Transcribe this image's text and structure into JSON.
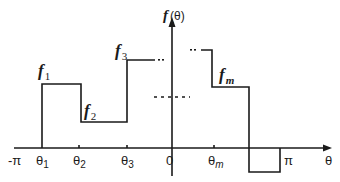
{
  "diagram": {
    "y_axis_label": "f (θ)",
    "x_axis_label": "θ",
    "x_ticks": [
      "-π",
      "θ1",
      "θ2",
      "θ3",
      "0",
      "θm",
      "π"
    ],
    "tick_labels": {
      "neg_pi": "-π",
      "theta1": "θ",
      "theta1_sub": "1",
      "theta2": "θ",
      "theta2_sub": "2",
      "theta3": "θ",
      "theta3_sub": "3",
      "zero": "0",
      "thetam": "θ",
      "thetam_sub": "m",
      "pi": "π",
      "theta_axis": "θ"
    },
    "segment_labels": {
      "f1": "f",
      "f1_sub": "1",
      "f2": "f",
      "f2_sub": "2",
      "f3": "f",
      "f3_sub": "3",
      "fm": "f",
      "fm_sub": "m",
      "axis_f": "f",
      "axis_paren": "(θ)"
    },
    "segments": [
      {
        "name": "f1",
        "from": "θ1",
        "to": "θ2",
        "level": "high"
      },
      {
        "name": "f2",
        "from": "θ2",
        "to": "θ3",
        "level": "low"
      },
      {
        "name": "f3",
        "from": "θ3",
        "to": "...",
        "level": "highest"
      },
      {
        "name": "fm",
        "from": "θm",
        "to": "...",
        "level": "mid"
      },
      {
        "name": "last",
        "from": "...",
        "to": "π",
        "level": "negative"
      }
    ],
    "line_color": "#1a1a1a"
  }
}
